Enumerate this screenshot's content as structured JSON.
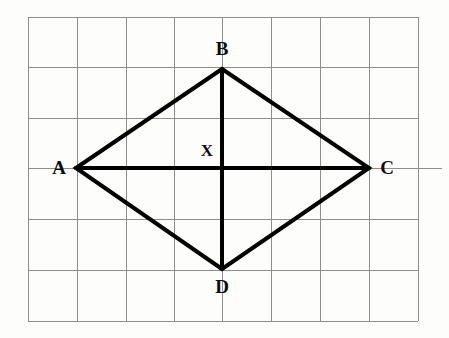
{
  "figure": {
    "background_color": "#fdfdfc",
    "grid": {
      "line_color": "#8d8d8d",
      "line_width": 1,
      "left": 28,
      "top": 17,
      "right": 418,
      "bottom": 321,
      "columns": 8,
      "rows": 6,
      "x_lines": [
        28,
        77,
        126,
        174,
        222,
        271,
        320,
        369,
        418
      ],
      "y_lines": [
        17,
        67,
        118,
        168,
        219,
        270,
        321
      ],
      "stub_left": {
        "x1": 28,
        "x2": 52,
        "y": 168
      },
      "stub_right": {
        "x1": 392,
        "x2": 442,
        "y": 168
      }
    },
    "shape": {
      "type": "quadrilateral",
      "name": "ABCD",
      "stroke_color": "#000000",
      "stroke_width": 4,
      "vertices": [
        {
          "label": "A",
          "x": 76,
          "y": 168
        },
        {
          "label": "B",
          "x": 222,
          "y": 69
        },
        {
          "label": "C",
          "x": 369,
          "y": 168
        },
        {
          "label": "D",
          "x": 222,
          "y": 269
        }
      ],
      "sides": [
        {
          "name": "AB",
          "from": "A",
          "to": "B"
        },
        {
          "name": "BC",
          "from": "B",
          "to": "C"
        },
        {
          "name": "CD",
          "from": "C",
          "to": "D"
        },
        {
          "name": "DA",
          "from": "D",
          "to": "A"
        }
      ],
      "diagonals": [
        {
          "name": "AC",
          "from": "A",
          "to": "C"
        },
        {
          "name": "BD",
          "from": "B",
          "to": "D"
        }
      ],
      "intersection": {
        "label": "X",
        "x": 222,
        "y": 168
      }
    },
    "labels": {
      "a": "A",
      "b": "B",
      "c": "C",
      "d": "D",
      "x": "X"
    }
  }
}
